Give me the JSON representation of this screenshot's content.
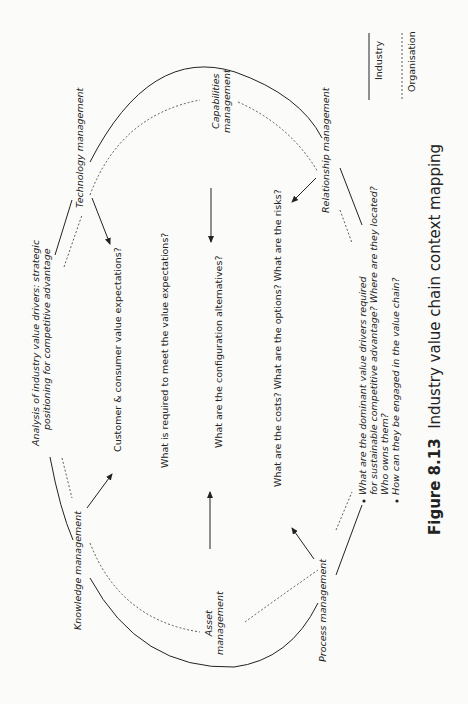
{
  "figure": {
    "number": "Figure 8.13",
    "title": "Industry value chain context mapping"
  },
  "legend": {
    "industry": "Industry",
    "organisation": "Organisation"
  },
  "nodes": {
    "analysis_line1": "Analysis of industry value drivers: strategic",
    "analysis_line2": "positioning for competitive advantage",
    "technology": "Technology management",
    "capabilities_line1": "Capabilities",
    "capabilities_line2": "management",
    "relationship": "Relationship management",
    "knowledge": "Knowledge management",
    "asset_line1": "Asset",
    "asset_line2": "management",
    "process": "Process management"
  },
  "questions": {
    "q1": "Customer & consumer value expectations?",
    "q2": "What is required to meet the value expectations?",
    "q3": "What are the configuration alternatives?",
    "q4": "What are the costs? What are the options? What are the risks?"
  },
  "bullets": {
    "b1_line1": "What are the dominant value drivers required",
    "b1_line2": "for sustainable competitive advantage? Where are they located?",
    "b1_line3": "Who owns them?",
    "b2_line1": "How can they be engaged in the value chain?"
  }
}
